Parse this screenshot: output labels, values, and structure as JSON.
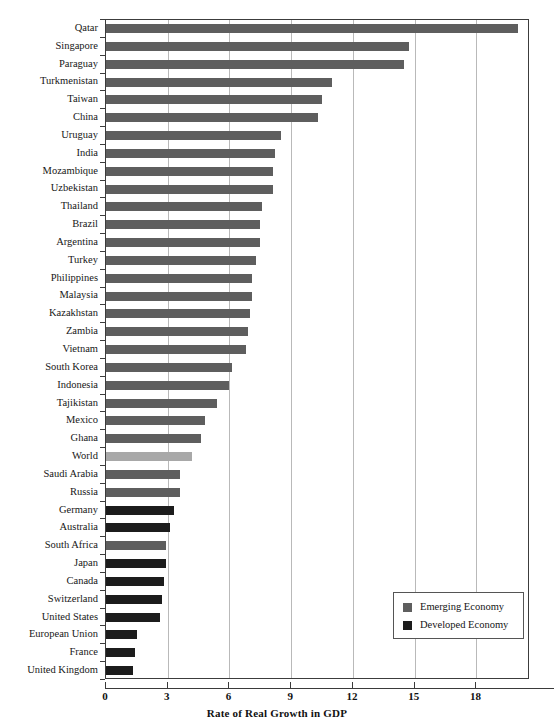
{
  "top_caption": "",
  "chart_data": {
    "type": "bar",
    "orientation": "horizontal",
    "title": "",
    "xlabel": "Rate of Real Growth in GDP",
    "ylabel": "",
    "xlim": [
      0,
      20.6
    ],
    "xticks": [
      0,
      3,
      6,
      9,
      12,
      15,
      18
    ],
    "xtick_labels": [
      "0",
      "3",
      "6",
      "9",
      "12",
      "15",
      "18"
    ],
    "grid": "vertical",
    "legend_position": "bottom-right",
    "legend": [
      {
        "label": "Emerging Economy",
        "color": "#5e5e5e",
        "key": "emerging"
      },
      {
        "label": "Developed Economy",
        "color": "#1c1c1c",
        "key": "developed"
      }
    ],
    "categories": [
      "Qatar",
      "Singapore",
      "Paraguay",
      "Turkmenistan",
      "Taiwan",
      "China",
      "Uruguay",
      "India",
      "Mozambique",
      "Uzbekistan",
      "Thailand",
      "Brazil",
      "Argentina",
      "Turkey",
      "Philippines",
      "Malaysia",
      "Kazakhstan",
      "Zambia",
      "Vietnam",
      "South Korea",
      "Indonesia",
      "Tajikistan",
      "Mexico",
      "Ghana",
      "World",
      "Saudi Arabia",
      "Russia",
      "Germany",
      "Australia",
      "South Africa",
      "Japan",
      "Canada",
      "Switzerland",
      "United States",
      "European Union",
      "France",
      "United Kingdom"
    ],
    "values": [
      20.0,
      14.7,
      14.5,
      11.0,
      10.5,
      10.3,
      8.5,
      8.2,
      8.1,
      8.1,
      7.6,
      7.5,
      7.5,
      7.3,
      7.1,
      7.1,
      7.0,
      6.9,
      6.8,
      6.1,
      6.0,
      5.4,
      4.8,
      4.6,
      4.2,
      3.6,
      3.6,
      3.3,
      3.1,
      2.9,
      2.9,
      2.8,
      2.7,
      2.6,
      1.5,
      1.4,
      1.3
    ],
    "series_key": [
      "emerging",
      "emerging",
      "emerging",
      "emerging",
      "emerging",
      "emerging",
      "emerging",
      "emerging",
      "emerging",
      "emerging",
      "emerging",
      "emerging",
      "emerging",
      "emerging",
      "emerging",
      "emerging",
      "emerging",
      "emerging",
      "emerging",
      "emerging",
      "emerging",
      "emerging",
      "emerging",
      "emerging",
      "world",
      "emerging",
      "emerging",
      "developed",
      "developed",
      "emerging",
      "developed",
      "developed",
      "developed",
      "developed",
      "developed",
      "developed",
      "developed"
    ]
  }
}
